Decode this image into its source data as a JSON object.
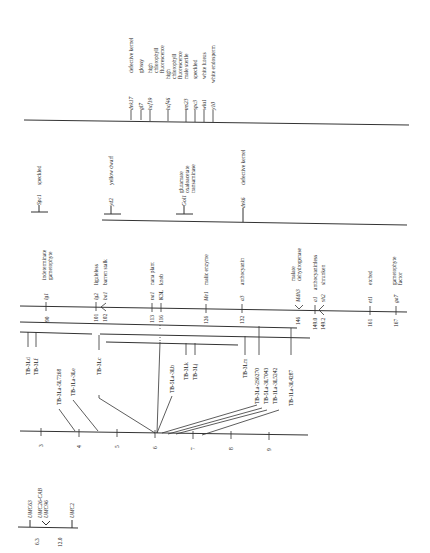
{
  "diagram": {
    "type": "genetic linkage map (rotated 90°)",
    "chromosome_arm": "3L"
  },
  "top_map": {
    "loci": [
      {
        "symbol": "dek17",
        "trait": "defective kernel",
        "x": 131
      },
      {
        "symbol": "gl7",
        "trait": "glossy",
        "x": 141
      },
      {
        "symbol": "hcf19",
        "trait": "high chlorophyll fluorescence",
        "x": 150
      },
      {
        "symbol": "hcf46",
        "trait": "high chlorophyll fluorescence",
        "x": 168
      },
      {
        "symbol": "ms23",
        "trait": "male sterile",
        "x": 186
      },
      {
        "symbol": "spc3",
        "trait": "speckled",
        "x": 195
      },
      {
        "symbol": "wlu1",
        "trait": "white luteus",
        "x": 204
      },
      {
        "symbol": "y10",
        "trait": "white endosperm",
        "x": 213
      }
    ]
  },
  "middle_map": {
    "loci": [
      {
        "symbol": "Spc1",
        "trait": "speckled",
        "x": 39
      },
      {
        "symbol": "yd2",
        "trait": "yellow dwarf",
        "x": 111
      },
      {
        "symbol": "Gol1",
        "trait": "glutamate oxaloacetate transaminase",
        "x": 184
      },
      {
        "symbol": "dek6",
        "trait": "defective kernel",
        "x": 243
      }
    ]
  },
  "main_map": {
    "loci": [
      {
        "symbol": "lg1",
        "trait": "indeterminate gametophyte",
        "position": "90",
        "x": 46
      },
      {
        "symbol": "lg2",
        "trait": "liguleless",
        "position": "101",
        "x": 96
      },
      {
        "symbol": "ba1",
        "trait": "barren stalk",
        "position": "102",
        "x": 102
      },
      {
        "symbol": "na1",
        "trait": "nana plant",
        "position": "113",
        "x": 152
      },
      {
        "symbol": "K3L",
        "trait": "knob",
        "position": "116",
        "x": 161
      },
      {
        "symbol": "Me1",
        "trait": "malic enzyme",
        "position": "126",
        "x": 206
      },
      {
        "symbol": "a3",
        "trait": "anthocyanin",
        "position": "132",
        "x": 242
      },
      {
        "symbol": "Mdh3",
        "trait": "malate dehydrogenase",
        "position": "146",
        "x": 298
      },
      {
        "symbol": "a1",
        "trait": "anthocyaninless",
        "position": "149.0",
        "x": 315
      },
      {
        "symbol": "sh2",
        "trait": "shrunken",
        "position": "149.2",
        "x": 322
      },
      {
        "symbol": "et1",
        "trait": "etched",
        "position": "161",
        "x": 370
      },
      {
        "symbol": "ga7",
        "trait": "gametophyte factor",
        "position": "167",
        "x": 396
      }
    ]
  },
  "translocations": [
    {
      "label": "TB-3Ld",
      "x": 28
    },
    {
      "label": "TB-3Lf",
      "x": 36
    },
    {
      "label": "TB-3La-5L7268",
      "x": 58
    },
    {
      "label": "TB-1La-3Le",
      "x": 72
    },
    {
      "label": "TB-3Lc",
      "x": 99
    },
    {
      "label": "TB-5La-3Lb",
      "x": 172
    },
    {
      "label": "TB-3Lk",
      "x": 186
    },
    {
      "label": "TB-3Lj",
      "x": 195
    },
    {
      "label": "TB-3Lm",
      "x": 245
    },
    {
      "label": "TB-3La-2S6270",
      "x": 257
    },
    {
      "label": "TB-5La-3L7043",
      "x": 266
    },
    {
      "label": "TB-1La-3L5242",
      "x": 275
    },
    {
      "label": "TB-1La-3L4287",
      "x": 291
    }
  ],
  "cytological_scale": {
    "ticks": [
      "3",
      "4",
      "5",
      "6",
      "7",
      "8",
      "9"
    ]
  },
  "umc_map": {
    "markers": [
      {
        "symbol": "UMC63",
        "position": "6.3"
      },
      {
        "symbol": "UMC26-CAB",
        "position": ""
      },
      {
        "symbol": "UMC96",
        "position": "12.0"
      },
      {
        "symbol": "UMC2",
        "position": ""
      }
    ]
  }
}
